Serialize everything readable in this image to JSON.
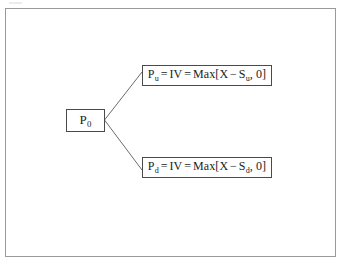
{
  "figure": {
    "type": "binomial-option-tree",
    "frame_color": "#9a9a9a",
    "box_border_color": "#4a4a4a",
    "line_color": "#6b6b6b",
    "background": "#ffffff",
    "root": {
      "symbol": "P",
      "subscript": "0",
      "full_text": "P0"
    },
    "up_branch": {
      "symbol": "P",
      "subscript": "u",
      "equals_1": "=",
      "intrinsic_value": "IV",
      "equals_2": "=",
      "function": "Max",
      "bracket_open": "[",
      "strike": "X",
      "minus": "−",
      "underlying_symbol": "S",
      "underlying_subscript": "u",
      "comma": ",",
      "floor": "0",
      "bracket_close": "]",
      "full_text": "Pu = IV = Max[X − Su, 0]"
    },
    "down_branch": {
      "symbol": "P",
      "subscript": "d",
      "equals_1": "=",
      "intrinsic_value": "IV",
      "equals_2": "=",
      "function": "Max",
      "bracket_open": "[",
      "strike": "X",
      "minus": "−",
      "underlying_symbol": "S",
      "underlying_subscript": "d",
      "comma": ",",
      "floor": "0",
      "bracket_close": "]",
      "full_text": "Pd = IV = Max[X − Sd, 0]"
    }
  }
}
